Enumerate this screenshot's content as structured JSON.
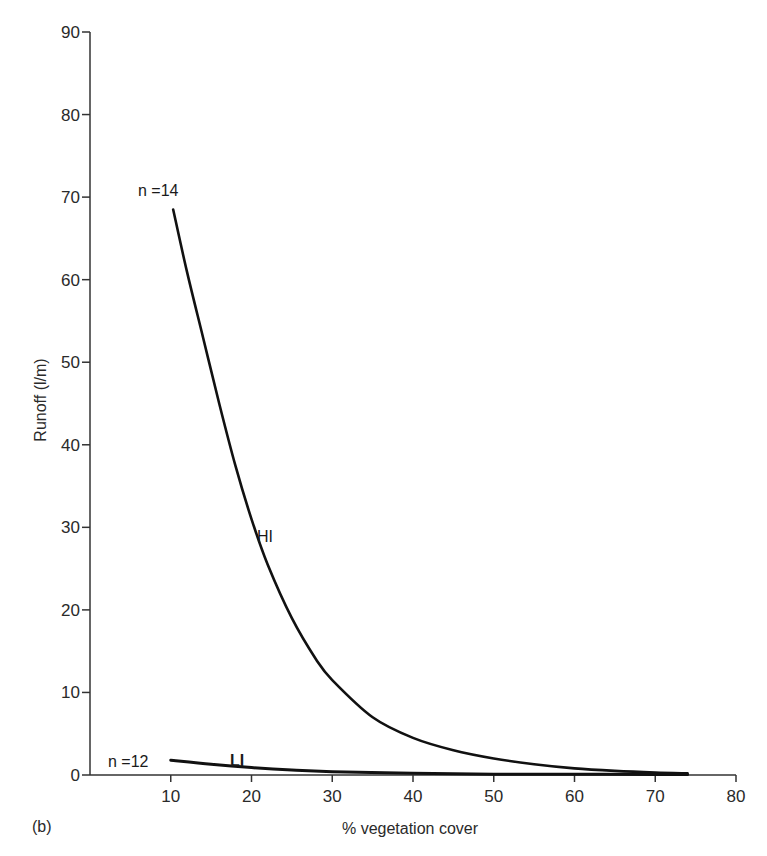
{
  "chart_data": {
    "type": "line",
    "title": "",
    "panel_label": "(b)",
    "xlabel": "% vegetation cover",
    "ylabel": "Runoff  (l/m)",
    "xlim": [
      0,
      80
    ],
    "ylim": [
      0,
      90
    ],
    "xticks": [
      10,
      20,
      30,
      40,
      50,
      60,
      70,
      80
    ],
    "yticks": [
      0,
      10,
      20,
      30,
      40,
      50,
      60,
      70,
      80,
      90
    ],
    "grid": false,
    "legend": "none (inline labels)",
    "series": [
      {
        "name": "HI",
        "n_label": "n =14",
        "x": [
          10.3,
          12,
          14,
          16,
          18,
          20,
          22,
          25,
          28,
          30,
          35,
          40,
          45,
          50,
          55,
          60,
          65,
          70,
          74
        ],
        "y": [
          68.5,
          61,
          53,
          45,
          37.5,
          31,
          25.5,
          19,
          14,
          11.5,
          7,
          4.5,
          3,
          2,
          1.3,
          0.8,
          0.5,
          0.3,
          0.2
        ]
      },
      {
        "name": "LI",
        "n_label": "n =12",
        "x": [
          10,
          15,
          20,
          25,
          30,
          40,
          50,
          60,
          70,
          74
        ],
        "y": [
          1.8,
          1.3,
          0.9,
          0.6,
          0.4,
          0.2,
          0.1,
          0.1,
          0.05,
          0.05
        ]
      }
    ],
    "annotations": [
      "n =14",
      "n =12",
      "HI",
      "LI",
      "(b)"
    ]
  }
}
